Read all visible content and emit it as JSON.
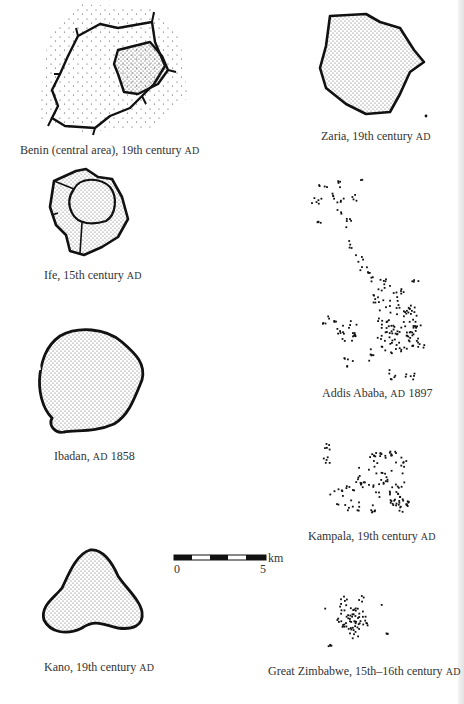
{
  "figure": {
    "plans": [
      {
        "id": "benin",
        "name": "Benin (central area), 19th century",
        "era": "AD",
        "style": "walled-enclosures"
      },
      {
        "id": "zaria",
        "name": "Zaria, 19th century",
        "era": "AD",
        "style": "walled-stippled"
      },
      {
        "id": "ife",
        "name": "Ife, 15th century",
        "era": "AD",
        "style": "walled-stippled"
      },
      {
        "id": "addis",
        "name": "Addis Ababa,",
        "era": "AD",
        "year": "1897",
        "style": "dot-clusters"
      },
      {
        "id": "ibadan",
        "name": "Ibadan,",
        "era": "AD",
        "year": "1858",
        "style": "walled-stippled"
      },
      {
        "id": "kampala",
        "name": "Kampala, 19th century",
        "era": "AD",
        "style": "dot-clusters"
      },
      {
        "id": "kano",
        "name": "Kano, 19th century",
        "era": "AD",
        "style": "walled-stippled"
      },
      {
        "id": "zimbabwe",
        "name": "Great Zimbabwe, 15th–16th century",
        "era": "AD",
        "style": "dot-clusters"
      }
    ],
    "scale": {
      "start": "0",
      "end": "5",
      "unit": "km"
    },
    "colors": {
      "ink": "#111111",
      "paper": "#ffffff",
      "text": "#333333"
    }
  }
}
